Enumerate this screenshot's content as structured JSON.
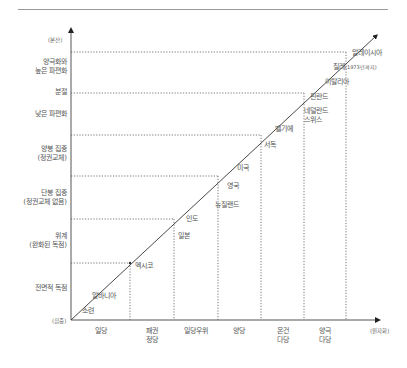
{
  "diagram": {
    "y_axis": {
      "top_label": "(분산)",
      "bottom_label": "(집중)",
      "levels": [
        {
          "label": "전면적 독점"
        },
        {
          "label_line1": "위계",
          "label_line2": "(완화된 독점)"
        },
        {
          "label_line1": "단봉 집중",
          "label_line2": "(정권교체 없음)"
        },
        {
          "label_line1": "양봉 집중",
          "label_line2": "(정권교체)"
        },
        {
          "label": "낮은 파편화"
        },
        {
          "label": "분절"
        },
        {
          "label_line1": "양극화와",
          "label_line2": "높은 파편화"
        }
      ]
    },
    "x_axis": {
      "right_label": "(원자화)",
      "categories": [
        {
          "label": "일당"
        },
        {
          "label_line1": "패권",
          "label_line2": "정당"
        },
        {
          "label": "일당우위"
        },
        {
          "label": "양당"
        },
        {
          "label_line1": "온건",
          "label_line2": "다당"
        },
        {
          "label_line1": "양극",
          "label_line2": "다당"
        }
      ]
    },
    "countries": [
      {
        "name": "소련"
      },
      {
        "name": "알바니아"
      },
      {
        "name": "멕시코"
      },
      {
        "name": "일본"
      },
      {
        "name": "인도"
      },
      {
        "name": "뉴질랜드"
      },
      {
        "name": "영국"
      },
      {
        "name": "미국"
      },
      {
        "name": "서독"
      },
      {
        "name": "벨기에"
      },
      {
        "name_line1": "네덜란드",
        "name_line2": "스위스"
      },
      {
        "name": "핀란드"
      },
      {
        "name": "이탈리아"
      },
      {
        "name": "칠레",
        "note": "(1973년까지)"
      },
      {
        "name": "말레이시아"
      }
    ]
  }
}
